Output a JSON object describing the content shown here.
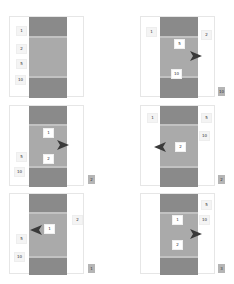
{
  "header": {
    "text": ""
  },
  "panels": [
    {
      "id": "p1",
      "labels": [
        "1",
        "2",
        "5",
        "10"
      ],
      "badge": "",
      "arrow": "none"
    },
    {
      "id": "p2",
      "labels": [
        "1",
        "5",
        "2",
        "10"
      ],
      "badge": "10",
      "arrow": "right"
    },
    {
      "id": "p3",
      "labels": [
        "1",
        "2",
        "5",
        "10"
      ],
      "badge": "2",
      "arrow": "right"
    },
    {
      "id": "p4",
      "labels": [
        "1",
        "5",
        "10",
        "2"
      ],
      "badge": "2",
      "arrow": "left"
    },
    {
      "id": "p5",
      "labels": [
        "1",
        "2",
        "5",
        "10"
      ],
      "badge": "1",
      "arrow": "left"
    },
    {
      "id": "p6",
      "labels": [
        "5",
        "10",
        "1",
        "2"
      ],
      "badge": "3",
      "arrow": "right"
    }
  ],
  "colors": {
    "band_dark": "#8a8a8a",
    "band_light": "#aaaaaa",
    "arrow": "#3a3a3a",
    "badge": "#b5b5b5"
  }
}
